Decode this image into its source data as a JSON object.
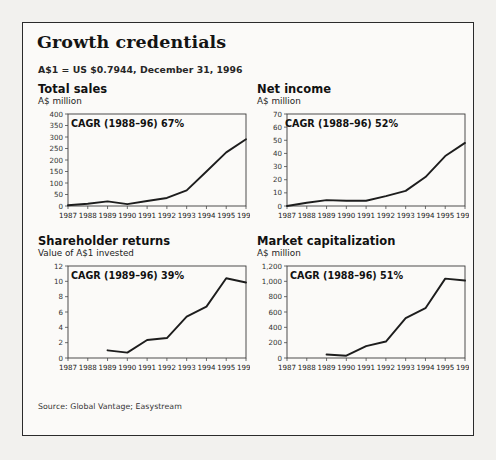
{
  "exhibit": {
    "title": "Growth credentials",
    "fx_note": "A$1 = US $0.7944, December 31, 1996",
    "source": "Source: Global Vantage; Easystream"
  },
  "panels": [
    {
      "key": "total-sales",
      "title": "Total sales",
      "subtitle": "A$ million",
      "cagr": "CAGR (1988–96) 67%"
    },
    {
      "key": "net-income",
      "title": "Net income",
      "subtitle": "A$ million",
      "cagr": "CAGR (1988–96) 52%"
    },
    {
      "key": "shareholder-returns",
      "title": "Shareholder returns",
      "subtitle": "Value of A$1 invested",
      "cagr": "CAGR (1989–96) 39%"
    },
    {
      "key": "market-capitalization",
      "title": "Market capitalization",
      "subtitle": "A$ million",
      "cagr": "CAGR (1988–96) 51%"
    }
  ],
  "chart_data": [
    {
      "type": "line",
      "key": "total-sales",
      "title": "Total sales",
      "subtitle": "A$ million",
      "ylabel": "A$ million",
      "xlabel": "",
      "annotation": "CAGR (1988–96) 67%",
      "grid": false,
      "legend": "none",
      "x": [
        1987,
        1988,
        1989,
        1990,
        1991,
        1992,
        1993,
        1994,
        1995,
        1996
      ],
      "xtick_labels": [
        "1987",
        "1988",
        "1989",
        "1990",
        "1991",
        "1992",
        "1993",
        "1994",
        "1995",
        "1996"
      ],
      "ylim": [
        0,
        400
      ],
      "yticks": [
        0,
        50,
        100,
        150,
        200,
        250,
        300,
        350,
        400
      ],
      "ytick_labels": [
        "0",
        "50",
        "100",
        "150",
        "200",
        "250",
        "300",
        "350",
        "400"
      ],
      "values": [
        3,
        10,
        20,
        8,
        22,
        35,
        68,
        150,
        233,
        290
      ]
    },
    {
      "type": "line",
      "key": "net-income",
      "title": "Net income",
      "subtitle": "A$ million",
      "ylabel": "A$ million",
      "xlabel": "",
      "annotation": "CAGR (1988–96) 52%",
      "grid": false,
      "legend": "none",
      "x": [
        1987,
        1988,
        1989,
        1990,
        1991,
        1992,
        1993,
        1994,
        1995,
        1996
      ],
      "xtick_labels": [
        "1987",
        "1988",
        "1989",
        "1990",
        "1991",
        "1992",
        "1993",
        "1994",
        "1995",
        "1996"
      ],
      "ylim": [
        0,
        70
      ],
      "yticks": [
        0,
        10,
        20,
        30,
        40,
        50,
        60,
        70
      ],
      "ytick_labels": [
        "0",
        "10",
        "20",
        "30",
        "40",
        "50",
        "60",
        "70"
      ],
      "values": [
        0,
        2.5,
        4.5,
        4,
        4,
        7.5,
        11.5,
        22,
        38,
        48
      ]
    },
    {
      "type": "line",
      "key": "shareholder-returns",
      "title": "Shareholder returns",
      "subtitle": "Value of A$1 invested",
      "ylabel": "Value of A$1 invested",
      "xlabel": "",
      "annotation": "CAGR (1989–96) 39%",
      "grid": false,
      "legend": "none",
      "x": [
        1989,
        1990,
        1991,
        1992,
        1993,
        1994,
        1995,
        1996
      ],
      "xtick_labels": [
        "1987",
        "1988",
        "1989",
        "1990",
        "1991",
        "1992",
        "1993",
        "1994",
        "1995",
        "1996"
      ],
      "ylim": [
        0,
        12
      ],
      "yticks": [
        0,
        2,
        4,
        6,
        8,
        10,
        12
      ],
      "ytick_labels": [
        "0",
        "2",
        "4",
        "6",
        "8",
        "10",
        "12"
      ],
      "values": [
        1.0,
        0.7,
        2.35,
        2.6,
        5.4,
        6.7,
        10.4,
        9.85
      ]
    },
    {
      "type": "line",
      "key": "market-capitalization",
      "title": "Market capitalization",
      "subtitle": "A$ million",
      "ylabel": "A$ million",
      "xlabel": "",
      "annotation": "CAGR (1988–96) 51%",
      "grid": false,
      "legend": "none",
      "x": [
        1989,
        1990,
        1991,
        1992,
        1993,
        1994,
        1995,
        1996
      ],
      "xtick_labels": [
        "1987",
        "1988",
        "1989",
        "1990",
        "1991",
        "1992",
        "1993",
        "1994",
        "1995",
        "1996"
      ],
      "ylim": [
        0,
        1200
      ],
      "yticks": [
        0,
        200,
        400,
        600,
        800,
        1000,
        1200
      ],
      "ytick_labels": [
        "0",
        "200",
        "400",
        "600",
        "800",
        "1,000",
        "1,200"
      ],
      "values": [
        45,
        30,
        155,
        215,
        520,
        650,
        1035,
        1010
      ]
    }
  ]
}
